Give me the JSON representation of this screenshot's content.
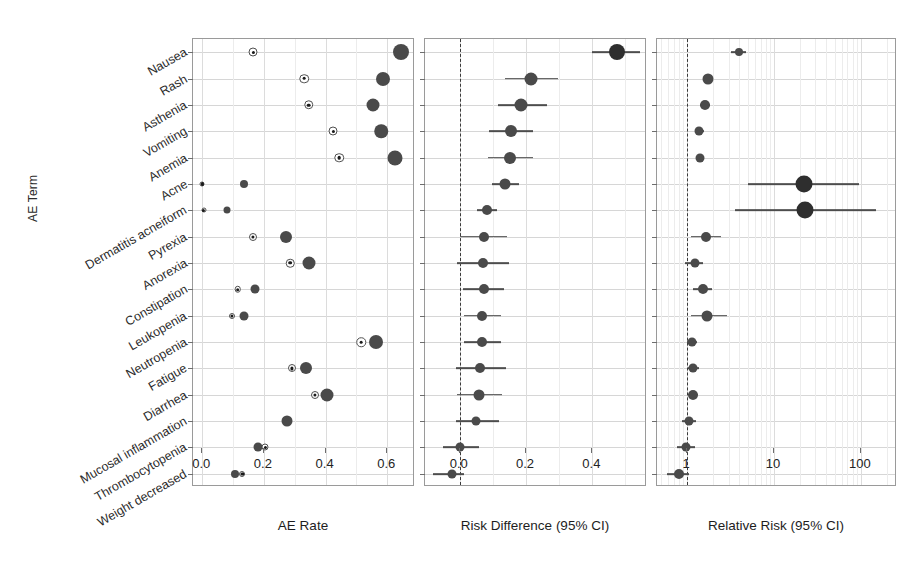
{
  "axes": {
    "y_title": "AE Term",
    "panelA_xlabel": "AE Rate",
    "panelB_xlabel": "Risk Difference (95% CI)",
    "panelC_xlabel": "Relative Risk (95% CI)",
    "panelA_ticks": [
      "0.0",
      "0.2",
      "0.4",
      "0.6"
    ],
    "panelB_ticks": [
      "0.0",
      "0.2",
      "0.4"
    ],
    "panelC_ticks": [
      "1",
      "10",
      "100"
    ]
  },
  "colors": {
    "marker_fill": "#4a4a4a",
    "marker_fill_dark": "#2e2e2e",
    "marker_open_edge": "#4f4f4f",
    "ci_line": "#4d4d4d",
    "grid": "#d6d6d6",
    "zero_reference": "#3a3a3a",
    "panel_border": "#9a9a9a"
  },
  "chart_data": {
    "type": "scatter",
    "title": "",
    "subtitle": "",
    "ylabel": "AE Term",
    "grid": true,
    "legend_position": "top",
    "categories": [
      "Nausea",
      "Rash",
      "Asthenia",
      "Vomiting",
      "Anemia",
      "Acne",
      "Dermatitis acneiform",
      "Pyrexia",
      "Anorexia",
      "Constipation",
      "Leukopenia",
      "Neutropenia",
      "Fatigue",
      "Diarrhea",
      "Mucosal inflammation",
      "Thrombocytopenia",
      "Weight decreased"
    ],
    "panels": [
      {
        "name": "AE Rate",
        "xlabel": "AE Rate",
        "xlim": [
          -0.03,
          0.69
        ],
        "ticks": [
          0.0,
          0.2,
          0.4,
          0.6
        ],
        "scale": "linear",
        "series": [
          {
            "name": "Control (open circle)",
            "marker": "open-circle",
            "values": [
              0.165,
              0.33,
              0.345,
              0.425,
              0.445,
              0.0,
              0.005,
              0.165,
              0.285,
              0.115,
              0.095,
              0.515,
              0.29,
              0.365,
              null,
              0.205,
              0.13
            ]
          },
          {
            "name": "Treatment (filled circle)",
            "marker": "filled-circle",
            "values": [
              0.645,
              0.585,
              0.555,
              0.58,
              0.625,
              0.135,
              0.08,
              0.27,
              0.345,
              0.17,
              0.135,
              0.565,
              0.335,
              0.405,
              0.275,
              0.18,
              0.105
            ]
          }
        ]
      },
      {
        "name": "Risk Difference",
        "xlabel": "Risk Difference (95% CI)",
        "xlim": [
          -0.105,
          0.565
        ],
        "ticks": [
          0.0,
          0.2,
          0.4
        ],
        "scale": "linear",
        "reference": 0.0,
        "points": [
          {
            "category": "Nausea",
            "estimate": 0.475,
            "low": 0.4,
            "high": 0.545,
            "size": 16
          },
          {
            "category": "Rash",
            "estimate": 0.215,
            "low": 0.135,
            "high": 0.295,
            "size": 13
          },
          {
            "category": "Asthenia",
            "estimate": 0.185,
            "low": 0.115,
            "high": 0.262,
            "size": 13
          },
          {
            "category": "Vomiting",
            "estimate": 0.155,
            "low": 0.088,
            "high": 0.222,
            "size": 12
          },
          {
            "category": "Anemia",
            "estimate": 0.152,
            "low": 0.085,
            "high": 0.222,
            "size": 12
          },
          {
            "category": "Acne",
            "estimate": 0.135,
            "low": 0.098,
            "high": 0.178,
            "size": 11
          },
          {
            "category": "Dermatitis acneiform",
            "estimate": 0.082,
            "low": 0.053,
            "high": 0.112,
            "size": 10
          },
          {
            "category": "Pyrexia",
            "estimate": 0.072,
            "low": 0.0,
            "high": 0.142,
            "size": 10
          },
          {
            "category": "Anorexia",
            "estimate": 0.07,
            "low": -0.008,
            "high": 0.148,
            "size": 10
          },
          {
            "category": "Constipation",
            "estimate": 0.072,
            "low": 0.01,
            "high": 0.132,
            "size": 10
          },
          {
            "category": "Leukopenia",
            "estimate": 0.068,
            "low": 0.012,
            "high": 0.125,
            "size": 10
          },
          {
            "category": "Neutropenia",
            "estimate": 0.068,
            "low": 0.012,
            "high": 0.125,
            "size": 10
          },
          {
            "category": "Fatigue",
            "estimate": 0.062,
            "low": -0.012,
            "high": 0.138,
            "size": 10
          },
          {
            "category": "Diarrhea",
            "estimate": 0.058,
            "low": -0.008,
            "high": 0.128,
            "size": 11
          },
          {
            "category": "Mucosal inflammation",
            "estimate": 0.048,
            "low": -0.012,
            "high": 0.118,
            "size": 9
          },
          {
            "category": "Thrombocytopenia",
            "estimate": 0.002,
            "low": -0.052,
            "high": 0.058,
            "size": 9
          },
          {
            "category": "Weight decreased",
            "estimate": -0.024,
            "low": -0.082,
            "high": 0.012,
            "size": 9
          }
        ]
      },
      {
        "name": "Relative Risk",
        "xlabel": "Relative Risk (95% CI)",
        "xlim": [
          0.45,
          260
        ],
        "ticks": [
          1,
          10,
          100
        ],
        "scale": "log",
        "reference": 1.0,
        "points": [
          {
            "category": "Nausea",
            "estimate": 3.9,
            "low": 3.2,
            "high": 4.7,
            "size": 8
          },
          {
            "category": "Rash",
            "estimate": 1.75,
            "low": 1.55,
            "high": 1.95,
            "size": 11
          },
          {
            "category": "Asthenia",
            "estimate": 1.62,
            "low": 1.42,
            "high": 1.82,
            "size": 10
          },
          {
            "category": "Vomiting",
            "estimate": 1.38,
            "low": 1.22,
            "high": 1.55,
            "size": 9
          },
          {
            "category": "Anemia",
            "estimate": 1.4,
            "low": 1.25,
            "high": 1.58,
            "size": 9
          },
          {
            "category": "Acne",
            "estimate": 22.0,
            "low": 5.0,
            "high": 95.0,
            "size": 17
          },
          {
            "category": "Dermatitis acneiform",
            "estimate": 23.0,
            "low": 3.6,
            "high": 150.0,
            "size": 17
          },
          {
            "category": "Pyrexia",
            "estimate": 1.65,
            "low": 1.1,
            "high": 2.45,
            "size": 10
          },
          {
            "category": "Anorexia",
            "estimate": 1.22,
            "low": 0.95,
            "high": 1.52,
            "size": 9
          },
          {
            "category": "Constipation",
            "estimate": 1.52,
            "low": 1.18,
            "high": 1.95,
            "size": 10
          },
          {
            "category": "Leukopenia",
            "estimate": 1.7,
            "low": 1.12,
            "high": 2.85,
            "size": 11
          },
          {
            "category": "Neutropenia",
            "estimate": 1.15,
            "low": 1.0,
            "high": 1.3,
            "size": 9
          },
          {
            "category": "Fatigue",
            "estimate": 1.18,
            "low": 1.02,
            "high": 1.38,
            "size": 9
          },
          {
            "category": "Diarrhea",
            "estimate": 1.16,
            "low": 1.02,
            "high": 1.32,
            "size": 10
          },
          {
            "category": "Mucosal inflammation",
            "estimate": 1.05,
            "low": 0.88,
            "high": 1.28,
            "size": 9
          },
          {
            "category": "Thrombocytopenia",
            "estimate": 0.96,
            "low": 0.76,
            "high": 1.22,
            "size": 9
          },
          {
            "category": "Weight decreased",
            "estimate": 0.8,
            "low": 0.58,
            "high": 1.05,
            "size": 10
          }
        ]
      }
    ]
  }
}
